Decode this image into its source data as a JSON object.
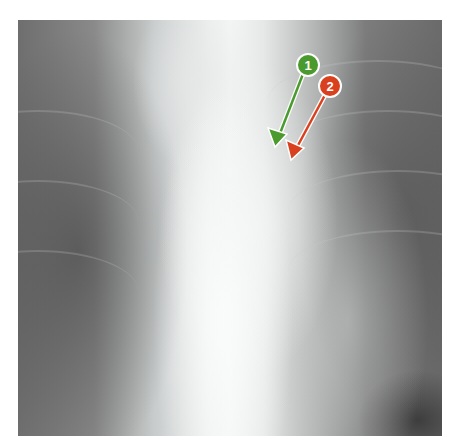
{
  "image": {
    "subject": "chest x-ray"
  },
  "annotations": [
    {
      "label": "1",
      "color": "#4a9a2e",
      "circle": {
        "cx": 308,
        "cy": 65,
        "r": 11
      },
      "arrow_tip": {
        "x": 275,
        "y": 145
      }
    },
    {
      "label": "2",
      "color": "#d9401e",
      "circle": {
        "cx": 330,
        "cy": 86,
        "r": 11
      },
      "arrow_tip": {
        "x": 292,
        "y": 158
      }
    }
  ]
}
